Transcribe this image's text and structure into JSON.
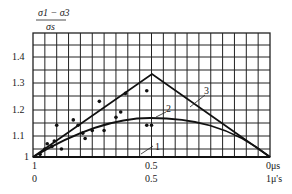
{
  "chart_data": {
    "type": "line",
    "title": "",
    "ylabel_numerator": "σ1 − σ3",
    "ylabel_denominator": "σs",
    "ylabel": "(σ1 − σ3) / σs",
    "xlabel_primary": "μσ",
    "xlabel_secondary": "μ'σ",
    "x_ticks_primary": [
      "1",
      "0.5",
      "0"
    ],
    "x_ticks_secondary": [
      "0",
      "0.5",
      "1"
    ],
    "y_ticks": [
      "1",
      "1.1",
      "1.2",
      "1.3",
      "1.4"
    ],
    "ylim": [
      1.0,
      1.5
    ],
    "grid": true,
    "series": [
      {
        "name": "1",
        "x": [
          0,
          1
        ],
        "y": [
          1.0,
          1.0
        ]
      },
      {
        "name": "2",
        "x": [
          0,
          0.25,
          0.5,
          0.75,
          1.0
        ],
        "y": [
          1.0,
          1.11,
          1.155,
          1.13,
          1.0
        ]
      },
      {
        "name": "3",
        "x": [
          0,
          0.5,
          1.0
        ],
        "y": [
          1.0,
          1.333,
          1.0
        ]
      }
    ],
    "scatter_points": [
      {
        "x": 0.03,
        "y": 1.01
      },
      {
        "x": 0.05,
        "y": 1.03
      },
      {
        "x": 0.06,
        "y": 1.05
      },
      {
        "x": 0.08,
        "y": 1.04
      },
      {
        "x": 0.09,
        "y": 1.06
      },
      {
        "x": 0.1,
        "y": 1.12
      },
      {
        "x": 0.12,
        "y": 1.03
      },
      {
        "x": 0.17,
        "y": 1.14
      },
      {
        "x": 0.19,
        "y": 1.12
      },
      {
        "x": 0.21,
        "y": 1.09
      },
      {
        "x": 0.22,
        "y": 1.07
      },
      {
        "x": 0.25,
        "y": 1.1
      },
      {
        "x": 0.28,
        "y": 1.21
      },
      {
        "x": 0.3,
        "y": 1.1
      },
      {
        "x": 0.35,
        "y": 1.15
      },
      {
        "x": 0.37,
        "y": 1.17
      },
      {
        "x": 0.39,
        "y": 1.24
      },
      {
        "x": 0.48,
        "y": 1.25
      },
      {
        "x": 0.48,
        "y": 1.12
      },
      {
        "x": 0.5,
        "y": 1.12
      }
    ]
  },
  "labels": {
    "y_num": "σ1 − σ3",
    "y_den": "σs",
    "y_ticks": [
      "1.4",
      "1.3",
      "1.2",
      "1.1",
      "1"
    ],
    "x_top": [
      "1",
      "0.5",
      "0μs"
    ],
    "x_bottom": [
      "0",
      "0.5",
      "1μ's"
    ],
    "curve_labels": [
      "3",
      "2",
      "1"
    ]
  }
}
